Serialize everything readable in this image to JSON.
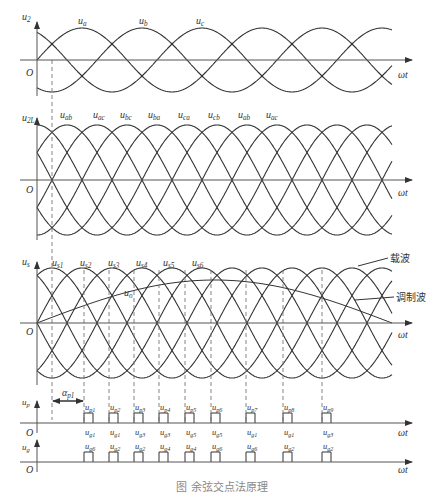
{
  "figure": {
    "caption": "图 余弦交点法原理",
    "panels": [
      {
        "id": "phase-voltages",
        "y_label": "u",
        "y_label_sub": "2",
        "origin": "O",
        "x_label": "ωt",
        "waves": [
          {
            "label": "u",
            "sub": "a"
          },
          {
            "label": "u",
            "sub": "b"
          },
          {
            "label": "u",
            "sub": "c"
          }
        ]
      },
      {
        "id": "line-voltages",
        "y_label": "u",
        "y_label_sub": "2L",
        "origin": "O",
        "x_label": "ωt",
        "waves": [
          {
            "label": "u",
            "sub": "ab"
          },
          {
            "label": "u",
            "sub": "ac"
          },
          {
            "label": "u",
            "sub": "bc"
          },
          {
            "label": "u",
            "sub": "ba"
          },
          {
            "label": "u",
            "sub": "ca"
          },
          {
            "label": "u",
            "sub": "cb"
          },
          {
            "label": "u",
            "sub": "ab"
          },
          {
            "label": "u",
            "sub": "ac"
          }
        ]
      },
      {
        "id": "synchronous-cosines",
        "y_label": "u",
        "y_label_sub": "s",
        "origin": "O",
        "x_label": "ωt",
        "waves": [
          {
            "label": "u",
            "sub": "s1"
          },
          {
            "label": "u",
            "sub": "s2"
          },
          {
            "label": "u",
            "sub": "s3"
          },
          {
            "label": "u",
            "sub": "s4"
          },
          {
            "label": "u",
            "sub": "s5"
          },
          {
            "label": "u",
            "sub": "s6"
          }
        ],
        "control_label": {
          "label": "u",
          "sub": "o"
        },
        "annotations": {
          "carrier": "载波",
          "modulating": "调制波"
        }
      },
      {
        "id": "pulse-up",
        "y_label": "u",
        "y_label_sub": "p",
        "origin": "O",
        "x_label": "ωt",
        "alpha_label": "α",
        "alpha_sub": "p1",
        "pulses": [
          {
            "label": "u",
            "sub": "p1"
          },
          {
            "label": "u",
            "sub": "p2"
          },
          {
            "label": "u",
            "sub": "p3"
          },
          {
            "label": "u",
            "sub": "p4"
          },
          {
            "label": "u",
            "sub": "p5"
          },
          {
            "label": "u",
            "sub": "p6"
          },
          {
            "label": "u",
            "sub": "p7"
          },
          {
            "label": "u",
            "sub": "p8"
          },
          {
            "label": "u",
            "sub": "p9"
          }
        ],
        "gate_row1": [
          "g1",
          "g1",
          "g3",
          "g3",
          "g5",
          "g5",
          "g1",
          "g1",
          "g3"
        ]
      },
      {
        "id": "pulse-ug",
        "y_label": "u",
        "y_label_sub": "g",
        "origin": "O",
        "x_label": "ωt",
        "gate_row2": [
          "g6",
          "g2",
          "g2",
          "g4",
          "g4",
          "g6",
          "g6",
          "g2",
          "g2"
        ]
      }
    ],
    "pulse_x": [
      84,
      109,
      134,
      159,
      185,
      211,
      246,
      283,
      322
    ],
    "dash_x": [
      52,
      84,
      109,
      134,
      159,
      185,
      211,
      246,
      283,
      322
    ],
    "colors": {
      "line": "#333333",
      "axis": "#555555",
      "dash": "#777777",
      "bg": "#ffffff"
    }
  }
}
